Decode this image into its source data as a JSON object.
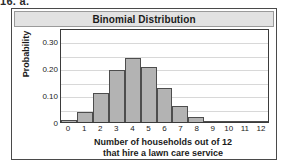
{
  "problem_label": "16. a.",
  "chart": {
    "title": "Binomial Distribution"
  },
  "chart_data": {
    "type": "bar",
    "title": "Binomial Distribution",
    "xlabel": "Number of households out of 12 that hire a lawn care service",
    "xlabel_line1": "Number of households out of 12",
    "xlabel_line2": "that hire a lawn care service",
    "ylabel": "Probability",
    "categories": [
      "0",
      "1",
      "2",
      "3",
      "4",
      "5",
      "6",
      "7",
      "8",
      "9",
      "10",
      "11",
      "12"
    ],
    "values": [
      0.006,
      0.037,
      0.109,
      0.195,
      0.237,
      0.204,
      0.128,
      0.059,
      0.02,
      0.005,
      0.001,
      0.0,
      0.0
    ],
    "ylim": [
      0,
      0.35
    ],
    "ytick_labels": [
      "0",
      "0.10",
      "0.20",
      "0.30"
    ],
    "ytick_values": [
      0,
      0.1,
      0.2,
      0.3
    ],
    "gridline_values": [
      0.05,
      0.1,
      0.15,
      0.2,
      0.25,
      0.3
    ],
    "grid": true,
    "legend": "none",
    "bar_fill_color": "#b3b3b3",
    "bar_border_color": "#4d4d4d",
    "title_bar_color": "#e2e2e2"
  }
}
